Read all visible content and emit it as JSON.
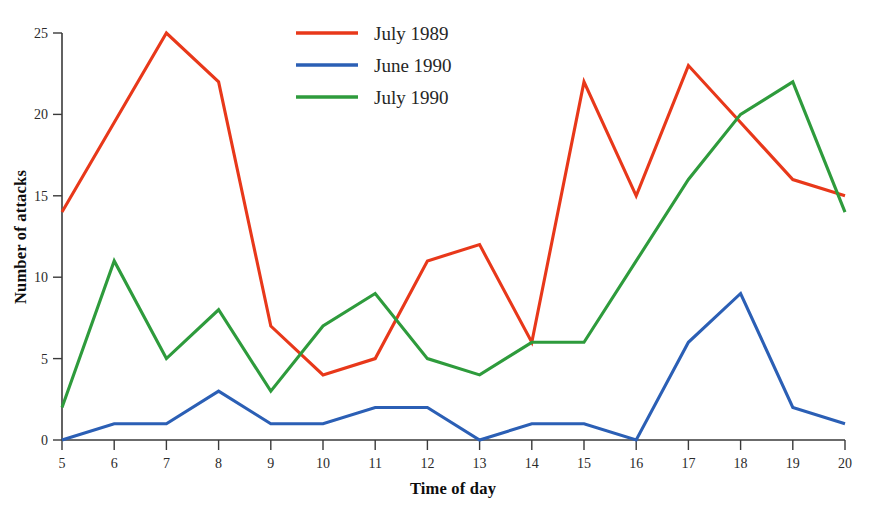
{
  "chart_data": {
    "type": "line",
    "title": "",
    "xlabel": "Time of day",
    "ylabel": "Number of attacks",
    "x": [
      5,
      6,
      7,
      8,
      9,
      10,
      11,
      12,
      13,
      14,
      15,
      16,
      17,
      18,
      19,
      20
    ],
    "xticklabels": [
      "5",
      "6",
      "7",
      "8",
      "9",
      "10",
      "11",
      "12",
      "13",
      "14",
      "15",
      "16",
      "17",
      "18",
      "19",
      "20"
    ],
    "yticks": [
      0,
      5,
      10,
      15,
      20,
      25
    ],
    "yticklabels": [
      "0",
      "5",
      "10",
      "15",
      "20",
      "25"
    ],
    "xlim": [
      5,
      20
    ],
    "ylim": [
      0,
      25
    ],
    "grid": false,
    "legend_position": "top-center",
    "series": [
      {
        "name": "July 1989",
        "color": "#E8381A",
        "values": [
          14,
          19.5,
          25,
          22,
          7,
          4,
          5,
          11,
          12,
          6,
          22,
          15,
          23,
          19.5,
          16,
          15
        ]
      },
      {
        "name": "June 1990",
        "color": "#2B5FB5",
        "values": [
          0,
          1,
          1,
          3,
          1,
          1,
          2,
          2,
          0,
          1,
          1,
          0,
          6,
          9,
          2,
          1
        ]
      },
      {
        "name": "July 1990",
        "color": "#2E9B3C",
        "values": [
          2,
          11,
          5,
          8,
          3,
          7,
          9,
          5,
          4,
          6,
          6,
          11,
          16,
          20,
          22,
          14
        ]
      }
    ]
  },
  "legend": {
    "entries": [
      {
        "label": "July 1989",
        "color": "#E8381A"
      },
      {
        "label": "June 1990",
        "color": "#2B5FB5"
      },
      {
        "label": "July 1990",
        "color": "#2E9B3C"
      }
    ]
  },
  "axes": {
    "x_title": "Time of day",
    "y_title": "Number of attacks"
  }
}
